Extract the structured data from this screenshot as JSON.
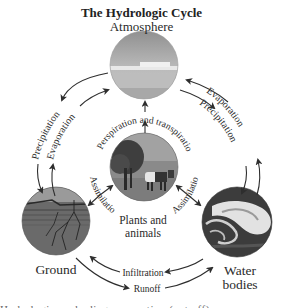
{
  "diagram": {
    "title": "The Hydrologic Cycle",
    "nodes": {
      "atmosphere": {
        "label": "Atmosphere",
        "image": "sky-over-sea"
      },
      "plants": {
        "label_line1": "Plants and",
        "label_line2": "animals",
        "image": "tree-and-cow"
      },
      "ground": {
        "label": "Ground",
        "image": "soil-cross-section-with-roots"
      },
      "water": {
        "label_line1": "Water",
        "label_line2": "bodies",
        "image": "ocean-wave"
      }
    },
    "edges": {
      "atm_to_ground": "Precipitation",
      "ground_to_atm": "Evaporation",
      "water_to_atm": "Evaporation",
      "atm_to_water": "Precipitation",
      "plants_to_atm": "Perspiration and transpiration",
      "ground_plants": "Assimilation",
      "water_plants": "Assimilation",
      "water_to_ground": "Infiltration",
      "ground_to_water": "Runoff"
    },
    "colors": {
      "arrow": "#2e2e2e",
      "text": "#2a2a2a",
      "sky_top": "#9a9a9a",
      "sky_bottom": "#c8c8c8",
      "ground": "#6e6e6e",
      "water_dark": "#3a3a3a"
    },
    "caption_cut": "Hydrologic cycle diagram caption (cut off)"
  }
}
